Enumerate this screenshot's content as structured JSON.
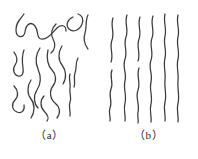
{
  "figure": {
    "background_color": "#ffffff",
    "stroke_color": "#3b3b3b",
    "caption_color": "#262626",
    "width": 198,
    "height": 159,
    "type": "line-drawing-diagram"
  },
  "panels": [
    {
      "id": "a",
      "caption": "（a）",
      "description": "randomly coiled and folded polymer chains",
      "chain_count": 10,
      "chains": [
        "M 24 14 C 20 20, 16 22, 16 30 C 16 38, 24 39, 25 32 C 26 24, 31 21, 35 26 C 39 31, 36 38, 41 39 C 47 40, 52 33, 57 28 C 61 24, 66 25, 66 31",
        "M 73 17 C 68 19, 65 25, 69 29 C 73 33, 80 30, 82 24 C 84 19, 82 15, 78 14",
        "M 88 15 C 85 21, 87 27, 85 33 C 83 39, 85 45, 88 49",
        "M 14 52 C 17 56, 18 61, 15 65 C 12 69, 14 75, 18 76 C 22 77, 24 73, 23 68 C 22 61, 22 55, 24 50",
        "M 40 48 C 36 54, 35 62, 38 69 C 41 76, 41 84, 37 90 C 33 96, 34 104, 38 108",
        "M 48 50 C 46 58, 48 66, 52 70 C 56 74, 57 81, 53 86 C 49 91, 50 99, 55 103 C 60 107, 61 113, 57 118",
        "M 62 46 C 58 52, 58 60, 62 65 C 66 70, 67 78, 63 84",
        "M 14 86 C 18 90, 19 96, 15 100 C 11 104, 12 110, 17 112 C 22 114, 25 110, 24 105",
        "M 31 80 C 27 86, 27 94, 31 99 C 35 104, 35 112, 31 118",
        "M 70 74 C 68 79, 71 83, 70 88 C 69 93, 72 97, 70 102 C 68 107, 71 111, 70 116",
        "M 78 58 C 75 63, 77 68, 75 73 C 73 78, 76 82, 74 87",
        "M 44 96 C 40 100, 40 107, 44 111 C 48 115, 49 119, 47 121",
        "M 56 24 C 52 28, 50 34, 53 39 C 56 44, 55 50, 51 53"
      ]
    },
    {
      "id": "b",
      "caption": "（b）",
      "description": "oriented, nearly parallel extended polymer chains",
      "chain_count": 7,
      "chains": [
        "M 14 18 C 11 26, 16 32, 13 40 C 10 48, 15 54, 12 62",
        "M 13 70 C 10 77, 15 82, 12 89 C 9 96, 14 101, 11 108 C 9 113, 12 117, 11 121",
        "M 28 15 C 25 23, 30 29, 27 37 C 24 45, 29 51, 26 59 C 23 67, 28 73, 26 81 C 24 89, 28 95, 26 103 C 24 110, 27 115, 26 121",
        "M 41 17 C 38 25, 43 31, 40 39 C 37 47, 42 53, 39 61",
        "M 40 68 C 37 76, 42 82, 39 90 C 36 98, 41 104, 39 112 C 38 117, 40 120, 39 123",
        "M 54 16 C 51 24, 56 30, 53 38 C 50 46, 55 52, 52 60 C 49 68, 54 74, 52 82 C 50 90, 54 96, 52 104 C 50 111, 53 116, 52 122",
        "M 66 14 C 64 22, 68 28, 66 36 C 64 44, 68 50, 66 58 C 64 66, 67 72, 66 80 C 65 88, 68 94, 66 102 C 64 110, 67 115, 66 121",
        "M 79 15 C 77 23, 81 29, 79 37 C 77 45, 81 51, 79 59 C 77 67, 80 73, 79 81 C 78 89, 81 95, 79 103 C 77 111, 80 116, 79 122"
      ]
    }
  ]
}
